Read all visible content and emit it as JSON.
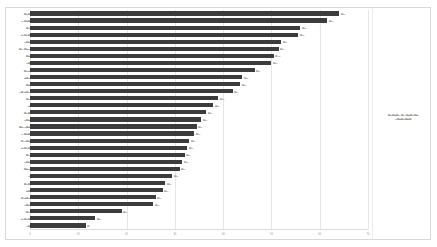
{
  "chart_data": {
    "type": "bar",
    "orientation": "horizontal",
    "title": "",
    "xlabel": "",
    "ylabel": "",
    "xlim": [
      0,
      70
    ],
    "grid": true,
    "legend_position": "right",
    "bar_color": "#3c3c3c",
    "label_color": "#9a9a9a",
    "xticks": [
      "0",
      "10",
      "20",
      "30",
      "40",
      "50",
      "60",
      "70"
    ],
    "categories": [
      "▃▁▃▂",
      "▁▃▂▃▁",
      "▃▁▃",
      "▂▃▁▃▂",
      "▁▃▂▃",
      "▃▁▃▂▁▃",
      "▃▂▃",
      "▁▃▂",
      "▃▁▂▃",
      "▂▃▁▃",
      "▃▂▁",
      "▁▃▂▃▁▃",
      "▃▁▃",
      "▂▃",
      "▃▁▃▂",
      "▁▃▂▃",
      "▃▂▁▃▂▃",
      "▁▃▂▃▁",
      "▃▁▃▂▃",
      "▂▃▁▃▂",
      "▃▁▂",
      "▁▃▂▃",
      "▃▂▁▃",
      "▁▃",
      "▃▁▃▂",
      "▂▃▁",
      "▃▂▃▁▃",
      "▁▃▂▃",
      "▃▁▃",
      "▂▃▁▃▂",
      "▁▃▂"
    ],
    "values": [
      64.0,
      61.5,
      56.0,
      55.5,
      52.0,
      51.5,
      50.5,
      50.0,
      46.5,
      44.0,
      43.5,
      42.0,
      39.0,
      38.0,
      36.5,
      35.5,
      34.5,
      34.0,
      33.0,
      32.5,
      32.0,
      31.5,
      31.0,
      29.5,
      28.0,
      27.5,
      26.0,
      25.5,
      19.0,
      13.5,
      11.5
    ],
    "value_labels": [
      "▃▁",
      "▃▁",
      "▃▁",
      "▃▁",
      "▃▁",
      "▃▁",
      "▃▁",
      "▃▁",
      "▃▁",
      "▃▁",
      "▃▁",
      "▃▁",
      "▃▁",
      "▃▁",
      "▃▁",
      "▃▁",
      "▃▁",
      "▃▁",
      "▃▁",
      "▃▁",
      "▃▁",
      "▃▁",
      "▃▁",
      "▃▁",
      "▃▁",
      "▃▁",
      "▃▁",
      "▃▁",
      "▃▁",
      "▃▁",
      "▃"
    ],
    "caption": {
      "line1": "▃▁▃▂▃▁ ▃▁▃▂▃▁▃▂",
      "line2": "▁▃▂▃▁▃▂▃"
    }
  }
}
